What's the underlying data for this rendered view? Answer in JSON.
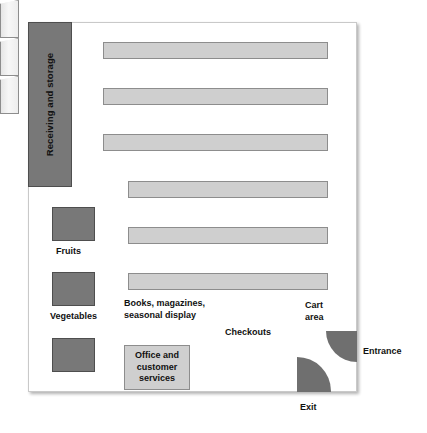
{
  "diagram": {
    "frame": {
      "name": "store-outline"
    },
    "zones": {
      "receiving": "Receiving and storage",
      "fruits": "Fruits",
      "vegetables": "Vegetables",
      "produce_unlabeled": "",
      "books": "Books, magazines, seasonal display",
      "cart_area": "Cart area",
      "checkouts": "Checkouts",
      "office": "Office and customer services",
      "entrance": "Entrance",
      "exit": "Exit"
    },
    "shelves": [
      {
        "name": "shelf-1",
        "row": "upper",
        "left": 103,
        "top": 42,
        "width": 225
      },
      {
        "name": "shelf-2",
        "row": "upper",
        "left": 103,
        "top": 88,
        "width": 225
      },
      {
        "name": "shelf-3",
        "row": "upper",
        "left": 103,
        "top": 134,
        "width": 225
      },
      {
        "name": "shelf-4",
        "row": "lower",
        "left": 128,
        "top": 181,
        "width": 200
      },
      {
        "name": "shelf-5",
        "row": "lower",
        "left": 128,
        "top": 227,
        "width": 200
      },
      {
        "name": "shelf-6",
        "row": "lower",
        "left": 128,
        "top": 273,
        "width": 200
      }
    ],
    "checkout_lanes": [
      {
        "name": "checkout-lane-1"
      },
      {
        "name": "checkout-lane-2"
      },
      {
        "name": "checkout-lane-3"
      }
    ],
    "colors": {
      "dark_fill": "#787878",
      "dark_stroke": "#4e4e4e",
      "light_fill": "#cfcfcf",
      "light_stroke": "#8d8d8d",
      "door_fill": "#6f6f6f",
      "background": "#ffffff",
      "text": "#111111"
    }
  }
}
